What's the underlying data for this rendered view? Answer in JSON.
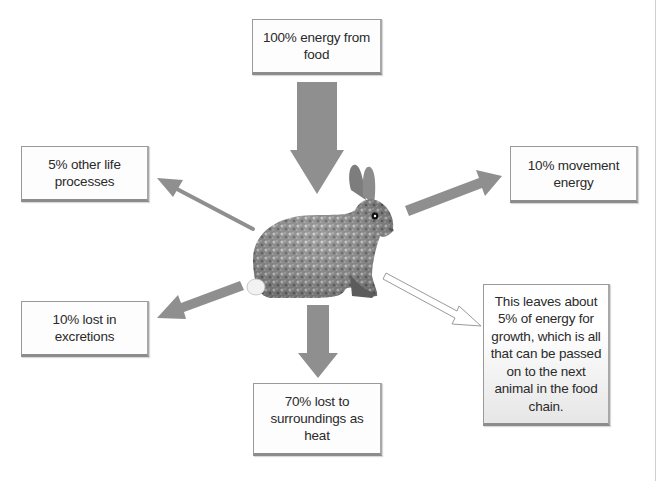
{
  "diagram": {
    "center": {
      "label": "rabbit",
      "icon": "rabbit-illustration"
    },
    "colors": {
      "arrow_fill": "#8f8f8f",
      "outline_arrow_stroke": "#9a9a9a",
      "box_border": "#9a9a9a",
      "text": "#2a2a2a"
    },
    "boxes": {
      "food": {
        "text": "100% energy from food"
      },
      "other_life": {
        "text": "5% other life processes"
      },
      "movement": {
        "text": "10% movement energy"
      },
      "excretions": {
        "text": "10% lost in excretions"
      },
      "heat": {
        "text": "70% lost to surroundings as heat"
      },
      "growth": {
        "text": "This leaves about 5% of energy for growth, which is all that can be passed on to the next animal in the food chain."
      }
    },
    "arrows": [
      {
        "from": "food",
        "to": "rabbit",
        "style": "thick-filled"
      },
      {
        "from": "rabbit",
        "to": "other_life",
        "style": "thin-filled"
      },
      {
        "from": "rabbit",
        "to": "movement",
        "style": "thick-filled"
      },
      {
        "from": "rabbit",
        "to": "excretions",
        "style": "thick-filled"
      },
      {
        "from": "rabbit",
        "to": "heat",
        "style": "thick-filled"
      },
      {
        "from": "rabbit",
        "to": "growth",
        "style": "outline"
      }
    ]
  }
}
